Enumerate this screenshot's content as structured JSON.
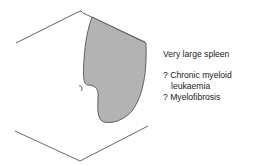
{
  "figure": {
    "colors": {
      "outline": "#555555",
      "spleen_fill": "#b3b3b3",
      "text": "#222222"
    }
  },
  "caption": {
    "title": "Very large spleen",
    "differentials": [
      {
        "prefix": "? ",
        "line1": "Chronic myeloid",
        "line2": "leukaemia"
      },
      {
        "prefix": "? ",
        "line1": "Myelofibrosis"
      }
    ]
  },
  "labels": {
    "umbilicus_mark": "?"
  }
}
